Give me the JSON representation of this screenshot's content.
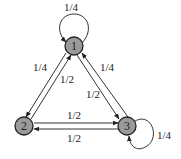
{
  "diagram": {
    "type": "markov-chain-state-diagram",
    "nodes": [
      {
        "id": "1",
        "label": "1",
        "x": 74,
        "y": 46
      },
      {
        "id": "2",
        "label": "2",
        "x": 24,
        "y": 126
      },
      {
        "id": "3",
        "label": "3",
        "x": 127,
        "y": 126
      }
    ],
    "edges": [
      {
        "from": "1",
        "to": "1",
        "label": "1/4"
      },
      {
        "from": "1",
        "to": "2",
        "label": "1/4"
      },
      {
        "from": "2",
        "to": "1",
        "label": "1/2"
      },
      {
        "from": "1",
        "to": "3",
        "label": "1/2"
      },
      {
        "from": "3",
        "to": "1",
        "label": "1/4"
      },
      {
        "from": "2",
        "to": "3",
        "label": "1/2"
      },
      {
        "from": "3",
        "to": "2",
        "label": "1/2"
      },
      {
        "from": "3",
        "to": "3",
        "label": "1/4"
      }
    ],
    "colors": {
      "node_fill": "#9a9a9a",
      "node_stroke": "#222222",
      "edge": "#333333"
    }
  }
}
